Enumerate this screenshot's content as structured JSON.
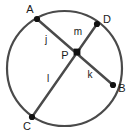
{
  "figure": {
    "type": "circle-with-two-intersecting-chords",
    "background_color": "#ffffff",
    "stroke_color": "#4a4a4a",
    "chord_color": "#4a4a4a",
    "point_color": "#111111",
    "text_color": "#1a1a1a",
    "circle": {
      "cx": 64.5,
      "cy": 68.5,
      "r": 57.5,
      "stroke_width": 2.2
    },
    "points": [
      {
        "name": "A",
        "label": "A",
        "x": 37,
        "y": 19,
        "label_x": 30,
        "label_y": 13,
        "anchor": "middle"
      },
      {
        "name": "D",
        "label": "D",
        "x": 97,
        "y": 24,
        "label_x": 107,
        "label_y": 23,
        "anchor": "middle"
      },
      {
        "name": "B",
        "label": "B",
        "x": 113,
        "y": 85,
        "label_x": 122,
        "label_y": 92,
        "anchor": "middle"
      },
      {
        "name": "C",
        "label": "C",
        "x": 32,
        "y": 117,
        "label_x": 27,
        "label_y": 130,
        "anchor": "middle"
      },
      {
        "name": "P",
        "label": "P",
        "x": 77,
        "y": 52,
        "label_x": 65,
        "label_y": 59,
        "anchor": "middle"
      }
    ],
    "point_radius": 3.1,
    "chords": [
      {
        "name": "chord-AB",
        "from": "A",
        "to": "B",
        "x1": 37,
        "y1": 19,
        "x2": 113,
        "y2": 85,
        "stroke_width": 2.4
      },
      {
        "name": "chord-CD",
        "from": "C",
        "to": "D",
        "x1": 32,
        "y1": 117,
        "x2": 97,
        "y2": 24,
        "stroke_width": 2.4
      }
    ],
    "segment_labels": [
      {
        "name": "j",
        "label": "j",
        "segment": "AP",
        "x": 46,
        "y": 43
      },
      {
        "name": "m",
        "label": "m",
        "segment": "PD",
        "x": 78,
        "y": 35
      },
      {
        "name": "k",
        "label": "k",
        "segment": "PB",
        "x": 90,
        "y": 78
      },
      {
        "name": "l",
        "label": "l",
        "segment": "PC",
        "x": 48,
        "y": 82
      }
    ]
  }
}
